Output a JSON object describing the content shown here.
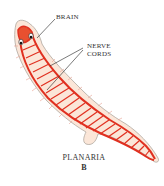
{
  "diagram": {
    "labels": {
      "brain": "BRAIN",
      "nerve_cords_line1": "NERVE",
      "nerve_cords_line2": "CORDS"
    },
    "caption": {
      "title": "PLANARIA",
      "panel": "B"
    },
    "colors": {
      "nerve": "#e03020",
      "body_fill": "#fbe6d8",
      "outline": "#b0a8a0",
      "text": "#333333"
    }
  }
}
